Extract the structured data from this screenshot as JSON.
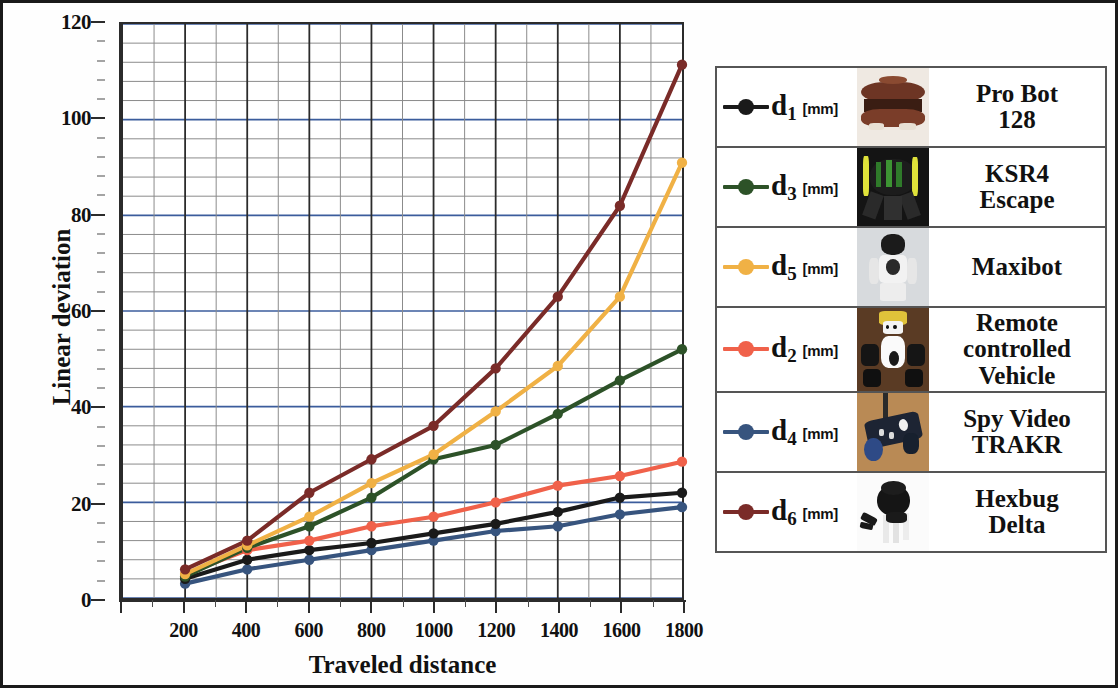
{
  "chart_data": {
    "type": "line",
    "title": "",
    "xlabel": "Traveled distance",
    "ylabel": "Linear deviation",
    "x": [
      200,
      400,
      600,
      800,
      1000,
      1200,
      1400,
      1600,
      1800
    ],
    "xlim": [
      0,
      1800
    ],
    "ylim": [
      0,
      120
    ],
    "y_ticks": [
      0,
      20,
      40,
      60,
      80,
      100,
      120
    ],
    "x_ticks": [
      200,
      400,
      600,
      800,
      1000,
      1200,
      1400,
      1600,
      1800
    ],
    "grid": true,
    "legend_position": "right",
    "series": [
      {
        "name": "d1 [mm]",
        "symbol": "d",
        "subscript": "1",
        "unit": "[mm]",
        "robot": "Pro Bot 128",
        "color": "#1a1a1a",
        "values": [
          4,
          8,
          10,
          11.5,
          13.5,
          15.5,
          18,
          21,
          22
        ]
      },
      {
        "name": "d3 [mm]",
        "symbol": "d",
        "subscript": "3",
        "unit": "[mm]",
        "robot": "KSR4 Escape",
        "color": "#2d5228",
        "values": [
          4.5,
          10.5,
          15,
          21,
          29,
          32,
          38.5,
          45.5,
          52
        ]
      },
      {
        "name": "d5 [mm]",
        "symbol": "d",
        "subscript": "5",
        "unit": "[mm]",
        "robot": "Maxibot",
        "color": "#f0b145",
        "values": [
          5,
          11,
          17,
          24,
          30,
          39,
          48.5,
          63,
          91
        ]
      },
      {
        "name": "d2 [mm]",
        "symbol": "d",
        "subscript": "2",
        "unit": "[mm]",
        "robot": "Remote controlled Vehicle",
        "color": "#f0614a",
        "values": [
          5,
          10,
          12,
          15,
          17,
          20,
          23.5,
          25.5,
          28.5
        ]
      },
      {
        "name": "d4 [mm]",
        "symbol": "d",
        "subscript": "4",
        "unit": "[mm]",
        "robot": "Spy Video TRAKR",
        "color": "#37547e",
        "values": [
          3,
          6,
          8,
          10,
          12,
          14,
          15,
          17.5,
          19
        ]
      },
      {
        "name": "d6 [mm]",
        "symbol": "d",
        "subscript": "6",
        "unit": "[mm]",
        "robot": "Hexbug Delta",
        "color": "#7a2b28",
        "values": [
          6,
          12,
          22,
          29,
          36,
          48,
          63,
          82,
          111.5
        ]
      }
    ]
  },
  "axes": {
    "y_title": "Linear deviation",
    "x_title": "Traveled distance",
    "y_tick_labels": [
      "0",
      "20",
      "40",
      "60",
      "80",
      "100",
      "120"
    ],
    "x_tick_labels": [
      "200",
      "400",
      "600",
      "800",
      "1000",
      "1200",
      "1400",
      "1600",
      "1800"
    ]
  },
  "legend": {
    "rows": [
      {
        "key": "d",
        "sub": "1",
        "unit": "[mm]",
        "name": "Pro Bot\n128",
        "name_lines": [
          "Pro Bot",
          "128"
        ],
        "color": "#1a1a1a",
        "thumb": "probot-128-photo"
      },
      {
        "key": "d",
        "sub": "3",
        "unit": "[mm]",
        "name": "KSR4\nEscape",
        "name_lines": [
          "KSR4",
          "Escape"
        ],
        "color": "#2d5228",
        "thumb": "ksr4-escape-photo"
      },
      {
        "key": "d",
        "sub": "5",
        "unit": "[mm]",
        "name": "Maxibot",
        "name_lines": [
          "Maxibot"
        ],
        "color": "#f0b145",
        "thumb": "maxibot-photo"
      },
      {
        "key": "d",
        "sub": "2",
        "unit": "[mm]",
        "name": "Remote controlled Vehicle",
        "name_lines": [
          "Remote",
          "controlled",
          "Vehicle"
        ],
        "color": "#f0614a",
        "thumb": "remote-controlled-vehicle-photo"
      },
      {
        "key": "d",
        "sub": "4",
        "unit": "[mm]",
        "name": "Spy Video TRAKR",
        "name_lines": [
          "Spy Video",
          "TRAKR"
        ],
        "color": "#37547e",
        "thumb": "spy-video-trakr-photo"
      },
      {
        "key": "d",
        "sub": "6",
        "unit": "[mm]",
        "name": "Hexbug Delta",
        "name_lines": [
          "Hexbug",
          "Delta"
        ],
        "color": "#7a2b28",
        "thumb": "hexbug-delta-photo"
      }
    ]
  },
  "colors": {
    "grid_minor": "#8a8a8a",
    "grid_major": "#2b2b2b",
    "grid_accent": "#3b5c9c",
    "frame": "#1a1a1a"
  }
}
